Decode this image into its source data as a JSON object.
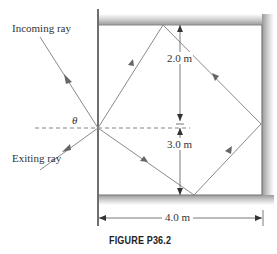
{
  "figure": {
    "caption": "FIGURE P36.2",
    "labels": {
      "incoming": "Incoming ray",
      "exiting": "Exiting ray",
      "theta": "θ",
      "top_distance": "2.0 m",
      "bottom_distance": "3.0 m",
      "width": "4.0 m"
    },
    "colors": {
      "ray": "#8a8a8a",
      "wall": "#6f6f6f",
      "mirror_shade": "#b5b5b5",
      "text": "#333333"
    }
  }
}
